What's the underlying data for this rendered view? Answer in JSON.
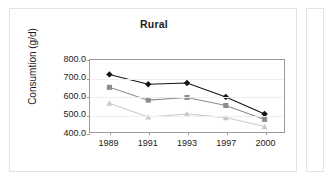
{
  "chart_data": {
    "type": "line",
    "title": "Rural",
    "xlabel": "",
    "ylabel": "Consumtion (g/d)",
    "categories": [
      "1989",
      "1991",
      "1993",
      "1997",
      "2000"
    ],
    "ylim": [
      400.0,
      800.0
    ],
    "ytick_labels": [
      "800.0",
      "700.0",
      "600.0",
      "500.0",
      "400.0"
    ],
    "ytick_values": [
      800.0,
      700.0,
      600.0,
      500.0,
      400.0
    ],
    "grid": true,
    "legend": "none",
    "series": [
      {
        "name": "series-1",
        "marker": "diamond",
        "color": "#151515",
        "values": [
          720,
          665,
          672,
          595,
          500
        ]
      },
      {
        "name": "series-2",
        "marker": "square",
        "color": "#8d8d8d",
        "values": [
          648,
          577,
          592,
          547,
          470
        ]
      },
      {
        "name": "series-3",
        "marker": "triangle",
        "color": "#c9c9c9",
        "values": [
          560,
          483,
          500,
          480,
          430
        ]
      }
    ]
  },
  "panel": {
    "border_color": "#e3e3e3",
    "plot_frame_color": "#9a9a9a",
    "gridline_color": "#eeeeee",
    "background": "#ffffff"
  }
}
